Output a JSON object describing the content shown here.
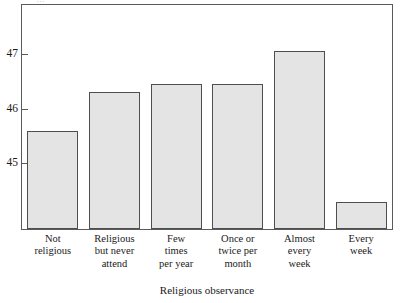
{
  "chart_data": {
    "type": "bar",
    "title": "",
    "subtitle": "",
    "xlabel": "Religious observance",
    "ylabel": "",
    "categories": [
      "Not religious",
      "Religious but never attend",
      "Few times per year",
      "Once or twice per month",
      "Almost every week",
      "Every week"
    ],
    "category_lines": [
      [
        "Not",
        "religious"
      ],
      [
        "Religious",
        "but never",
        "attend"
      ],
      [
        "Few",
        "times",
        "per year"
      ],
      [
        "Once or",
        "twice per",
        "month"
      ],
      [
        "Almost",
        "every",
        "week"
      ],
      [
        "Every",
        "week"
      ]
    ],
    "values": [
      45.6,
      46.3,
      46.45,
      46.45,
      47.05,
      44.3
    ],
    "ylim": [
      43.8,
      47.9
    ],
    "yticks": [
      45,
      46,
      47
    ],
    "ytick_labels": [
      "45",
      "46",
      "47"
    ],
    "grid": false,
    "legend": false,
    "bar_fill": "#e4e4e4",
    "bar_edge": "#4e4e4e",
    "frame_color": "#5a5a5a",
    "background": "#ffffff"
  },
  "artifacts": {
    "top_fragment": "…"
  }
}
